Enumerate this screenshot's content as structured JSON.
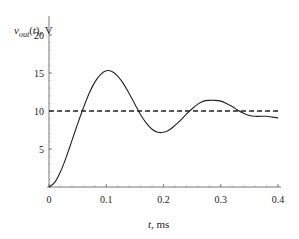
{
  "chart_data": {
    "type": "line",
    "title": "",
    "xlabel": "t, ms",
    "ylabel": "v_out(t), V",
    "ylabel_parts": {
      "var": "v",
      "sub": "out",
      "rest": "(t), V"
    },
    "xlabel_parts": {
      "var": "t",
      "rest": ", ms"
    },
    "xlim": [
      0,
      0.4
    ],
    "ylim": [
      0,
      20
    ],
    "x_ticks": [
      "0",
      "0.1",
      "0.2",
      "0.3",
      "0.4"
    ],
    "y_ticks": [
      "5",
      "10",
      "15",
      "20"
    ],
    "grid": false,
    "legend": null,
    "series": [
      {
        "name": "v_out(t)",
        "style": "solid",
        "x": [
          0,
          0.01,
          0.02,
          0.03,
          0.04,
          0.05,
          0.06,
          0.07,
          0.08,
          0.09,
          0.1,
          0.11,
          0.12,
          0.13,
          0.14,
          0.15,
          0.16,
          0.17,
          0.18,
          0.19,
          0.2,
          0.21,
          0.22,
          0.23,
          0.24,
          0.25,
          0.26,
          0.27,
          0.28,
          0.29,
          0.3,
          0.31,
          0.32,
          0.33,
          0.34,
          0.35,
          0.36,
          0.37,
          0.38,
          0.39,
          0.4
        ],
        "values": [
          0,
          0.6,
          2.0,
          3.9,
          6.1,
          8.3,
          10.4,
          12.3,
          13.8,
          14.8,
          15.3,
          15.2,
          14.6,
          13.6,
          12.3,
          10.9,
          9.5,
          8.4,
          7.6,
          7.2,
          7.2,
          7.5,
          8.1,
          8.8,
          9.6,
          10.3,
          10.9,
          11.3,
          11.4,
          11.4,
          11.3,
          11.0,
          10.6,
          10.1,
          9.7,
          9.4,
          9.3,
          9.3,
          9.3,
          9.2,
          9.1
        ]
      },
      {
        "name": "steady-state",
        "style": "dashed",
        "x": [
          0,
          0.4
        ],
        "values": [
          10,
          10
        ]
      }
    ]
  }
}
